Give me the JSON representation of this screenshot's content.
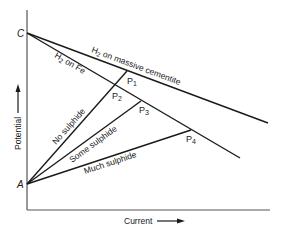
{
  "diagram": {
    "axes": {
      "y_label": "Potential",
      "x_label": "Current"
    },
    "points": {
      "C": "C",
      "A": "A",
      "P1": {
        "main": "P",
        "sub": "1"
      },
      "P2": {
        "main": "P",
        "sub": "2"
      },
      "P3": {
        "main": "P",
        "sub": "3"
      },
      "P4": {
        "main": "P",
        "sub": "4"
      }
    },
    "cathodic_lines": [
      {
        "id": "massive-cementite",
        "prefix": "H",
        "sub": "2",
        "suffix": " on massive cementite"
      },
      {
        "id": "fe",
        "prefix": "H",
        "sub": "2",
        "suffix": " on Fe"
      }
    ],
    "anodic_lines": [
      {
        "id": "no-sulphide",
        "label": "No sulphide"
      },
      {
        "id": "some-sulphide",
        "label": "Some sulphide"
      },
      {
        "id": "much-sulphide",
        "label": "Much sulphide"
      }
    ],
    "colors": {
      "line": "#1a1a1a",
      "axis": "#555555",
      "background": "#ffffff"
    }
  }
}
